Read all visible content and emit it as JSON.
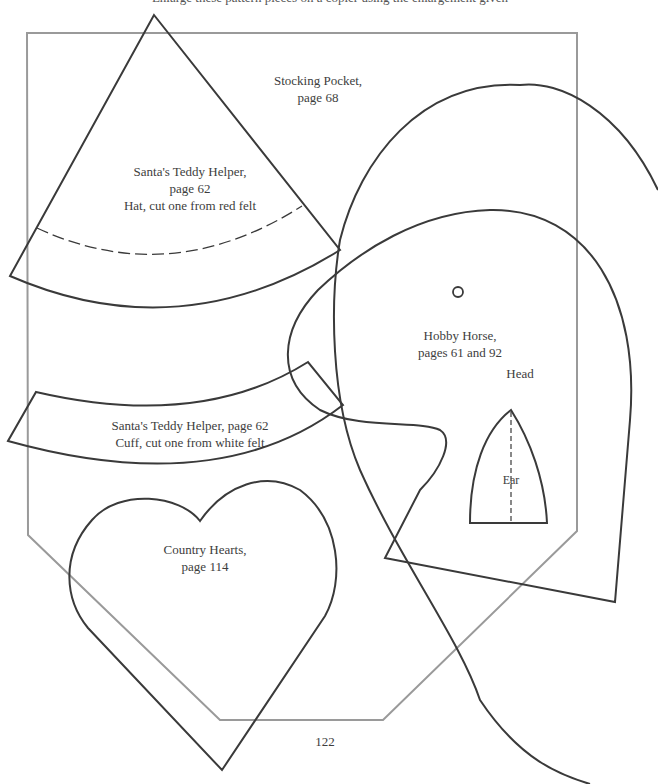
{
  "page": {
    "top_caption": "Enlarge these pattern pieces on a copier using the enlargement given",
    "page_number": "122"
  },
  "patterns": {
    "stocking_pocket": {
      "line1": "Stocking Pocket,",
      "line2": "page 68"
    },
    "teddy_hat": {
      "line1": "Santa's Teddy Helper,",
      "line2": "page 62",
      "line3": "Hat, cut one from red felt"
    },
    "teddy_cuff": {
      "line1": "Santa's Teddy Helper, page 62",
      "line2": "Cuff, cut one from white felt"
    },
    "hobby_horse": {
      "line1": "Hobby Horse,",
      "line2": "pages 61 and 92",
      "head_label": "Head",
      "ear_label": "Ear"
    },
    "country_hearts": {
      "line1": "Country Hearts,",
      "line2": "page 114"
    }
  },
  "colors": {
    "outline": "#3a3a3a",
    "pocket_outline": "#9a9a9a",
    "background": "#ffffff"
  }
}
